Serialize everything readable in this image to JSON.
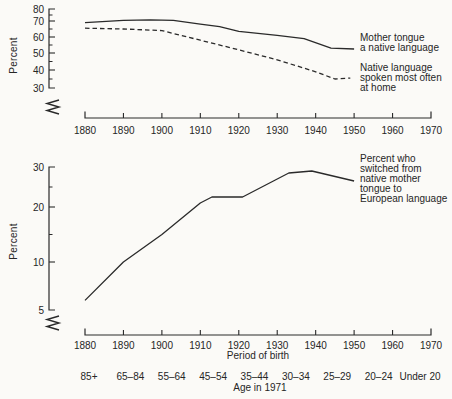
{
  "figure": {
    "background": "#fbfaf7",
    "ink_color": "#2a2a2a"
  },
  "chart_data": [
    {
      "type": "line",
      "title": "",
      "ylabel": "Percent",
      "xlabel": "",
      "ylim": [
        30,
        80
      ],
      "xlim": [
        1880,
        1970
      ],
      "y_ticks": [
        80,
        70,
        60,
        50,
        40,
        30
      ],
      "y_minor_ticks": [
        75,
        65,
        55,
        45,
        35
      ],
      "x_ticks": [
        1880,
        1890,
        1900,
        1910,
        1920,
        1930,
        1940,
        1950,
        1960,
        1970
      ],
      "axis_break": true,
      "grid": false,
      "legend_position": "right-of-line-ends",
      "series": [
        {
          "name": "Mother tongue a native language",
          "label_lines": [
            "Mother tongue",
            "a native language"
          ],
          "style": "solid",
          "points": [
            [
              1880,
              69
            ],
            [
              1890,
              70.5
            ],
            [
              1897,
              71
            ],
            [
              1903,
              70.5
            ],
            [
              1910,
              68
            ],
            [
              1915,
              66.5
            ],
            [
              1920,
              63.5
            ],
            [
              1930,
              61
            ],
            [
              1937,
              59
            ],
            [
              1944,
              53
            ],
            [
              1950,
              52.5
            ]
          ]
        },
        {
          "name": "Native language spoken most often at home",
          "label_lines": [
            "Native language",
            "spoken most often",
            "at home"
          ],
          "style": "dashed",
          "points": [
            [
              1880,
              65.5
            ],
            [
              1890,
              65
            ],
            [
              1900,
              64
            ],
            [
              1910,
              58
            ],
            [
              1920,
              52
            ],
            [
              1930,
              46
            ],
            [
              1940,
              39
            ],
            [
              1945,
              35
            ],
            [
              1949,
              35.5
            ]
          ]
        }
      ]
    },
    {
      "type": "line",
      "title": "",
      "ylabel": "Percent",
      "xlabel": "Period of birth",
      "ylim": [
        5,
        30
      ],
      "xlim": [
        1880,
        1970
      ],
      "y_ticks": [
        30,
        20,
        10,
        5
      ],
      "y_minor_ticks": [
        25,
        15
      ],
      "x_ticks": [
        1880,
        1890,
        1900,
        1910,
        1920,
        1930,
        1940,
        1950,
        1960,
        1970
      ],
      "axis_break": true,
      "grid": false,
      "secondary_x_axis": {
        "label": "Age in 1971",
        "categories": [
          "85+",
          "65–84",
          "55–64",
          "45–54",
          "35–44",
          "30–34",
          "25–29",
          "20–24",
          "Under 20"
        ]
      },
      "series": [
        {
          "name": "Percent who switched from native mother tongue to European language",
          "label_lines": [
            "Percent who",
            "switched from",
            "native mother",
            "tongue to",
            "European language"
          ],
          "style": "solid",
          "points": [
            [
              1880,
              6
            ],
            [
              1890,
              10
            ],
            [
              1900,
              15
            ],
            [
              1910,
              21
            ],
            [
              1913,
              22.5
            ],
            [
              1921,
              22.5
            ],
            [
              1933,
              28.5
            ],
            [
              1939,
              29
            ],
            [
              1950,
              26.5
            ]
          ]
        }
      ]
    }
  ]
}
